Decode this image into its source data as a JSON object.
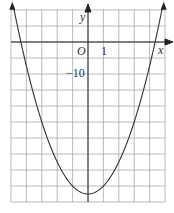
{
  "chart_data": {
    "type": "line",
    "title": "",
    "xlabel": "x",
    "ylabel": "y",
    "origin_label": "O",
    "x_tick_label": "1",
    "y_tick_label": "-10",
    "xlim": [
      -5,
      5
    ],
    "ylim": [
      -100,
      20
    ],
    "grid": true,
    "x_grid_step": 1,
    "y_grid_step": 10,
    "series": [
      {
        "name": "parabola",
        "equation": "y = 5x^2 - 95",
        "x": [
          -4.8,
          -4,
          -3,
          -2,
          -1,
          0,
          1,
          2,
          3,
          4,
          4.8
        ],
        "y": [
          20.2,
          -15,
          -50,
          -75,
          -90,
          -95,
          -90,
          -75,
          -50,
          -15,
          20.2
        ]
      }
    ]
  },
  "labels": {
    "x": "x",
    "y": "y",
    "origin": "O",
    "one": "1",
    "minus_ten": "−10"
  }
}
